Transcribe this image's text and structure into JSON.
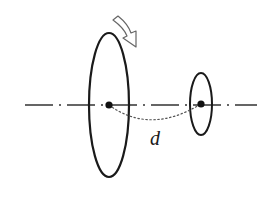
{
  "diagram": {
    "type": "physics-rotating-disks",
    "colors": {
      "stroke": "#1a1a1a",
      "dotted": "#555555",
      "axis": "#333333",
      "arrow_fill": "#ffffff",
      "arrow_stroke": "#555555",
      "background": "#ffffff"
    },
    "axis": {
      "x1": 25,
      "x2": 257,
      "y": 105,
      "style": "dash-dot"
    },
    "large_disk": {
      "cx": 109,
      "cy": 105,
      "rx": 20,
      "ry": 72,
      "center_dot": true
    },
    "small_disk": {
      "cx": 201,
      "cy": 104,
      "rx": 11,
      "ry": 31,
      "center_dot": true
    },
    "distance_curve": {
      "style": "dotted",
      "from": [
        109,
        105
      ],
      "to": [
        201,
        104
      ],
      "sag_y": 122
    },
    "rotation_arrow": {
      "style": "hollow",
      "direction": "clockwise"
    },
    "labels": {
      "distance": "d"
    }
  }
}
